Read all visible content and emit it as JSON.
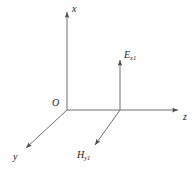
{
  "figure": {
    "type": "coordinate-axes-diagram",
    "background_color": "#ffffff",
    "line_color": "#6e6e6e",
    "text_color": "#1a1a1a"
  },
  "axes": {
    "x": {
      "label": "x",
      "direction": "up",
      "origin": [
        67,
        110
      ],
      "tip": [
        67,
        10
      ]
    },
    "y": {
      "label": "y",
      "direction": "down-left",
      "origin": [
        67,
        110
      ],
      "tip": [
        24,
        150
      ]
    },
    "z": {
      "label": "z",
      "direction": "right",
      "origin": [
        67,
        110
      ],
      "tip": [
        180,
        110
      ]
    }
  },
  "origin": {
    "label": "O",
    "position": [
      67,
      110
    ]
  },
  "vectors": [
    {
      "name": "electric-field",
      "label_base": "E",
      "label_sub": "x1",
      "direction": "up",
      "start": [
        120,
        110
      ],
      "tip": [
        120,
        58
      ]
    },
    {
      "name": "magnetic-field",
      "label_base": "H",
      "label_sub": "y1",
      "direction": "down-left",
      "start": [
        120,
        110
      ],
      "tip": [
        93,
        147
      ]
    }
  ]
}
